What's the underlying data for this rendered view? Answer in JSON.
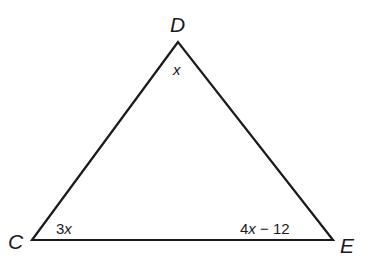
{
  "diagram": {
    "type": "triangle",
    "vertices": [
      {
        "name": "D",
        "x": 178,
        "y": 42,
        "angle": "x"
      },
      {
        "name": "C",
        "x": 32,
        "y": 240,
        "angle": "3x"
      },
      {
        "name": "E",
        "x": 333,
        "y": 240,
        "angle": "4x − 12"
      }
    ],
    "labels": {
      "D": "D",
      "C": "C",
      "E": "E"
    },
    "angles": {
      "D": {
        "coef": "",
        "var": "x"
      },
      "C": {
        "coef": "3",
        "var": "x"
      },
      "E": {
        "coef": "4",
        "var": "x",
        "rest": " − 12"
      }
    },
    "stroke_color": "#1a1a1a"
  }
}
